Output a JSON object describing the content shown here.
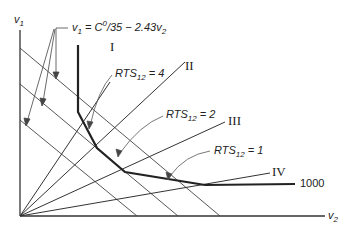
{
  "diagram": {
    "axes": {
      "y_label": "v",
      "y_sub": "1",
      "x_label": "v",
      "x_sub": "2"
    },
    "budget_equation": {
      "lhs": "v",
      "lhs_sub": "1",
      "eq": " = C",
      "sup": "0",
      "rest": "/35 − 2.43v",
      "rest_sub": "2"
    },
    "rays": [
      {
        "label": "I"
      },
      {
        "label": "II"
      },
      {
        "label": "III"
      },
      {
        "label": "IV"
      }
    ],
    "rts_labels": [
      {
        "text": "RTS",
        "sub": "12",
        "value": " = 4"
      },
      {
        "text": "RTS",
        "sub": "12",
        "value": " = 2"
      },
      {
        "text": "RTS",
        "sub": "12",
        "value": " = 1"
      }
    ],
    "isoquant_label": "1000",
    "colors": {
      "line": "#333333",
      "isoquant": "#222222"
    }
  }
}
